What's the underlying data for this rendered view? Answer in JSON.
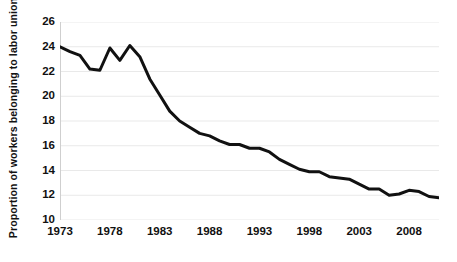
{
  "chart_data": {
    "type": "line",
    "title": "",
    "subtitle": "",
    "xlabel": "",
    "ylabel": "Proportion of workers belonging to labor union",
    "xlim": [
      1973,
      2011
    ],
    "ylim": [
      10,
      26
    ],
    "xticks": [
      1973,
      1978,
      1983,
      1988,
      1993,
      1998,
      2003,
      2008
    ],
    "yticks": [
      10,
      12,
      14,
      16,
      18,
      20,
      22,
      24,
      26
    ],
    "grid": "horizontal",
    "legend": "none",
    "line_color": "#111111",
    "line_width": 3,
    "x": [
      1973,
      1974,
      1975,
      1976,
      1977,
      1978,
      1979,
      1980,
      1981,
      1982,
      1983,
      1984,
      1985,
      1986,
      1987,
      1988,
      1989,
      1990,
      1991,
      1992,
      1993,
      1994,
      1995,
      1996,
      1997,
      1998,
      1999,
      2000,
      2001,
      2002,
      2003,
      2004,
      2005,
      2006,
      2007,
      2008,
      2009,
      2010,
      2011
    ],
    "values": [
      24.0,
      23.6,
      23.3,
      22.2,
      22.1,
      23.9,
      22.9,
      24.1,
      23.2,
      21.4,
      20.1,
      18.8,
      18.0,
      17.5,
      17.0,
      16.8,
      16.4,
      16.1,
      16.1,
      15.8,
      15.8,
      15.5,
      14.9,
      14.5,
      14.1,
      13.9,
      13.9,
      13.5,
      13.4,
      13.3,
      12.9,
      12.5,
      12.5,
      12.0,
      12.1,
      12.4,
      12.3,
      11.9,
      11.8
    ],
    "annotations": []
  }
}
